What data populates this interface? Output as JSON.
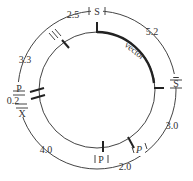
{
  "diagram": {
    "type": "plasmid-map",
    "inner_circle_label": "vector",
    "outer_labels": {
      "site_top": "S",
      "site_right": "S",
      "site_bottom_right": "P",
      "site_bottom": "P",
      "site_left_p": "P",
      "site_left_x": "X"
    },
    "distances": {
      "top_left": "2.5",
      "top_right": "5.2",
      "right": "3.0",
      "bottom_right": "2.0",
      "bottom_left": "4.0",
      "left_small": "0.2",
      "left_upper": "3.3"
    }
  }
}
